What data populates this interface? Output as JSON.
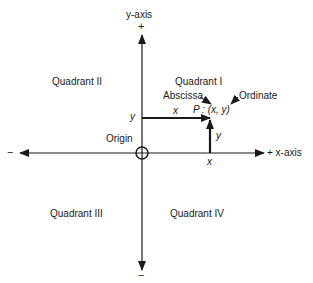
{
  "axes": {
    "y_axis_label": "y-axis",
    "x_axis_label": "+ x-axis",
    "y_positive_sign": "+",
    "y_negative_sign": "−",
    "x_negative_sign": "−"
  },
  "quadrants": {
    "q1": "Quadrant I",
    "q2": "Quadrant II",
    "q3": "Quadrant III",
    "q4": "Quadrant IV"
  },
  "origin_label": "Origin",
  "point": {
    "label": "P : (x, y)",
    "abscissa_label": "Abscissa",
    "ordinate_label": "Ordinate",
    "x_segment_label": "x",
    "y_segment_label": "y",
    "y_axis_tick_label": "y",
    "x_axis_tick_label": "x"
  },
  "colors": {
    "line": "#1a1a1a",
    "background": "#ffffff"
  }
}
